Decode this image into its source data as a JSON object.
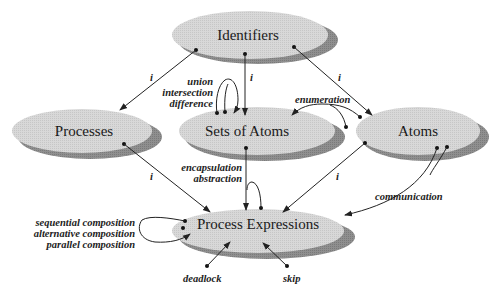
{
  "diagram": {
    "nodes": {
      "identifiers": {
        "label": "Identifiers"
      },
      "processes": {
        "label": "Processes"
      },
      "sets_of_atoms": {
        "label": "Sets of Atoms"
      },
      "atoms": {
        "label": "Atoms"
      },
      "process_expressions": {
        "label": "Process Expressions"
      }
    },
    "edge_labels": {
      "i_id_proc": "i",
      "i_id_sets": "i",
      "i_id_atoms": "i",
      "i_proc_pe": "i",
      "i_atoms_pe": "i",
      "union": "union",
      "intersection": "intersection",
      "difference": "difference",
      "enumeration": "enumeration",
      "encapsulation": "encapsulation",
      "abstraction": "abstraction",
      "communication": "communication",
      "sequential": "sequential composition",
      "alternative": "alternative composition",
      "parallel": "parallel composition",
      "deadlock": "deadlock",
      "skip": "skip"
    },
    "colors": {
      "ellipse_fill": "#d6d6d6",
      "ellipse_shadow": "#8a8a8a",
      "line": "#222222"
    }
  }
}
